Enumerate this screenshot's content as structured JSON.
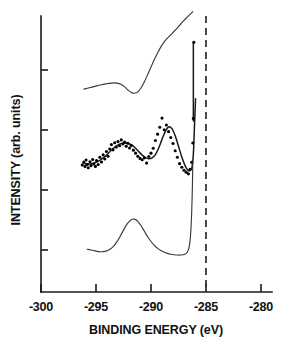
{
  "chart_data": {
    "type": "line",
    "title": "",
    "xlabel": "BINDING ENERGY (eV)",
    "ylabel": "INTENSITY (arb. units)",
    "xlim": [
      -301.5,
      -277.5
    ],
    "ylim": [
      0,
      1
    ],
    "grid": false,
    "legend": "none",
    "xticks": [
      -300,
      -295,
      -290,
      -285,
      -280
    ],
    "xtick_labels": [
      "-300",
      "-295",
      "-290",
      "-285",
      "-280"
    ],
    "yticks": [
      0.22,
      0.41,
      0.6,
      0.79
    ],
    "ytick_labels": [
      "",
      "",
      "",
      ""
    ],
    "annotations": [
      {
        "name": "reference-line",
        "type": "vertical-dashed-line",
        "x": -285.0
      }
    ],
    "series": [
      {
        "name": "top-spectrum",
        "style": "line",
        "x": [
          -296.1,
          -295.6,
          -295.1,
          -294.6,
          -294.1,
          -293.6,
          -293.1,
          -292.7,
          -292.4,
          -292.1,
          -291.8,
          -291.5,
          -291.2,
          -290.9,
          -290.6,
          -290.3,
          -290.0,
          -289.7,
          -289.4,
          -289.1,
          -288.8,
          -288.5,
          -288.2,
          -287.9,
          -287.6,
          -287.3,
          -287.0,
          -286.7,
          -286.4,
          -286.2
        ],
        "y": [
          0.735,
          0.74,
          0.745,
          0.75,
          0.754,
          0.757,
          0.757,
          0.752,
          0.743,
          0.732,
          0.723,
          0.72,
          0.725,
          0.74,
          0.762,
          0.788,
          0.815,
          0.842,
          0.866,
          0.888,
          0.906,
          0.92,
          0.932,
          0.944,
          0.957,
          0.971,
          0.984,
          0.996,
          1.008,
          1.016
        ]
      },
      {
        "name": "top-vertical-edge",
        "style": "line",
        "x": [
          -286.15,
          -286.15
        ],
        "y": [
          0.905,
          0.62
        ]
      },
      {
        "name": "middle-fit-curve",
        "style": "line",
        "x": [
          -296.2,
          -295.9,
          -295.6,
          -295.3,
          -295.0,
          -294.7,
          -294.4,
          -294.1,
          -293.8,
          -293.5,
          -293.2,
          -292.9,
          -292.6,
          -292.3,
          -292.0,
          -291.7,
          -291.4,
          -291.1,
          -290.8,
          -290.5,
          -290.2,
          -289.9,
          -289.6,
          -289.3,
          -289.0,
          -288.7,
          -288.4,
          -288.1,
          -287.8,
          -287.5,
          -287.2,
          -286.9,
          -286.6,
          -286.3,
          -286.15,
          -286.05,
          -285.95
        ],
        "y": [
          0.468,
          0.465,
          0.464,
          0.466,
          0.47,
          0.476,
          0.484,
          0.494,
          0.506,
          0.518,
          0.528,
          0.535,
          0.539,
          0.54,
          0.537,
          0.531,
          0.521,
          0.508,
          0.496,
          0.487,
          0.483,
          0.486,
          0.498,
          0.522,
          0.553,
          0.582,
          0.598,
          0.592,
          0.566,
          0.528,
          0.489,
          0.458,
          0.44,
          0.448,
          0.5,
          0.6,
          0.7
        ]
      },
      {
        "name": "middle-data-points",
        "style": "scatter",
        "x": [
          -296.25,
          -296.1,
          -296.0,
          -295.9,
          -295.8,
          -295.7,
          -295.55,
          -295.45,
          -295.3,
          -295.2,
          -295.05,
          -294.95,
          -294.8,
          -294.65,
          -294.5,
          -294.35,
          -294.2,
          -294.05,
          -293.9,
          -293.75,
          -293.6,
          -293.45,
          -293.3,
          -293.15,
          -293.0,
          -292.85,
          -292.7,
          -292.55,
          -292.4,
          -292.25,
          -292.1,
          -291.95,
          -291.8,
          -291.6,
          -291.4,
          -291.2,
          -291.0,
          -290.8,
          -290.6,
          -290.4,
          -290.2,
          -290.0,
          -289.8,
          -289.6,
          -289.4,
          -289.2,
          -289.0,
          -288.8,
          -288.6,
          -288.4,
          -288.2,
          -288.0,
          -287.8,
          -287.6,
          -287.4,
          -287.2,
          -287.0,
          -286.8,
          -286.6,
          -286.45,
          -286.3,
          -286.2,
          -286.15,
          -286.1
        ],
        "y": [
          0.46,
          0.471,
          0.455,
          0.478,
          0.462,
          0.45,
          0.472,
          0.458,
          0.48,
          0.464,
          0.455,
          0.476,
          0.462,
          0.488,
          0.471,
          0.497,
          0.482,
          0.509,
          0.492,
          0.518,
          0.534,
          0.515,
          0.541,
          0.525,
          0.545,
          0.53,
          0.551,
          0.536,
          0.543,
          0.528,
          0.539,
          0.522,
          0.531,
          0.514,
          0.503,
          0.492,
          0.484,
          0.479,
          0.486,
          0.467,
          0.491,
          0.503,
          0.521,
          0.549,
          0.572,
          0.597,
          0.63,
          0.588,
          0.605,
          0.581,
          0.56,
          0.538,
          0.512,
          0.488,
          0.465,
          0.452,
          0.441,
          0.434,
          0.428,
          0.445,
          0.47,
          0.54,
          0.629,
          0.905
        ]
      },
      {
        "name": "bottom-spectrum",
        "style": "line",
        "x": [
          -295.8,
          -295.4,
          -295.0,
          -294.6,
          -294.2,
          -293.8,
          -293.4,
          -293.0,
          -292.6,
          -292.2,
          -291.8,
          -291.5,
          -291.2,
          -290.9,
          -290.6,
          -290.3,
          -290.0,
          -289.7,
          -289.4,
          -289.1,
          -288.8,
          -288.5,
          -288.2,
          -287.9,
          -287.6,
          -287.3,
          -287.0,
          -286.7,
          -286.5,
          -286.35,
          -286.25,
          -286.2
        ],
        "y": [
          0.155,
          0.152,
          0.148,
          0.146,
          0.147,
          0.153,
          0.166,
          0.188,
          0.217,
          0.245,
          0.262,
          0.264,
          0.256,
          0.24,
          0.22,
          0.2,
          0.183,
          0.169,
          0.158,
          0.15,
          0.144,
          0.14,
          0.137,
          0.135,
          0.134,
          0.134,
          0.136,
          0.144,
          0.17,
          0.24,
          0.36,
          0.47
        ]
      }
    ]
  },
  "axes": {
    "x_axis_name": "binding-energy-axis",
    "y_axis_name": "intensity-axis"
  }
}
